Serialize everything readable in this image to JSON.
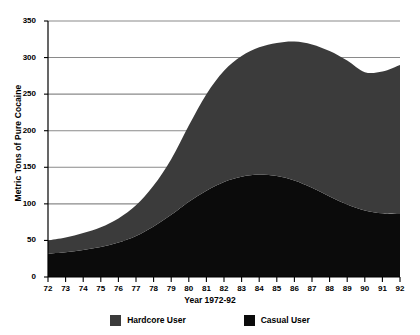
{
  "chart_data": {
    "type": "area",
    "title": "",
    "subtitle": "",
    "xlabel": "Year 1972-92",
    "ylabel": "Metric Tons of Pure Cocaine",
    "stacked": true,
    "grid": true,
    "legend_position": "bottom",
    "xlim": [
      72,
      92
    ],
    "ylim": [
      0,
      350
    ],
    "ytick_labels": [
      "0",
      "50",
      "100",
      "150",
      "200",
      "250",
      "300",
      "350"
    ],
    "yticks": [
      0,
      50,
      100,
      150,
      200,
      250,
      300,
      350
    ],
    "categories": [
      "72",
      "73",
      "74",
      "75",
      "76",
      "77",
      "78",
      "79",
      "80",
      "81",
      "82",
      "83",
      "84",
      "85",
      "86",
      "87",
      "88",
      "89",
      "90",
      "91",
      "92"
    ],
    "x": [
      72,
      73,
      74,
      75,
      76,
      77,
      78,
      79,
      80,
      81,
      82,
      83,
      84,
      85,
      86,
      87,
      88,
      89,
      90,
      91,
      92
    ],
    "series": [
      {
        "name": "Casual User",
        "color": "#0b0b0b",
        "values": [
          32,
          34,
          37,
          41,
          47,
          56,
          69,
          85,
          103,
          118,
          130,
          137,
          140,
          138,
          132,
          122,
          110,
          99,
          91,
          87,
          86
        ]
      },
      {
        "name": "Hardcore User",
        "color": "#3b3b3b",
        "values": [
          18,
          20,
          23,
          27,
          33,
          42,
          56,
          76,
          104,
          132,
          152,
          165,
          174,
          182,
          190,
          196,
          199,
          197,
          189,
          194,
          204
        ]
      }
    ],
    "totals": [
      50,
      54,
      60,
      68,
      80,
      98,
      125,
      161,
      207,
      250,
      282,
      302,
      314,
      320,
      322,
      318,
      309,
      296,
      280,
      281,
      290
    ]
  },
  "legend": {
    "items": [
      {
        "label": "Hardcore User",
        "color": "#3b3b3b"
      },
      {
        "label": "Casual User",
        "color": "#0b0b0b"
      }
    ]
  },
  "axes": {
    "y_title": "Metric Tons of Pure Cocaine",
    "x_title": "Year 1972-92"
  }
}
